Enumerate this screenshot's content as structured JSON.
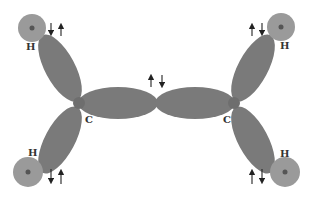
{
  "diagram": {
    "colors": {
      "orbital": "#7a7a7a",
      "hydrogen_shell": "#9a9a9a",
      "nucleus": "#555555",
      "arrow": "#222222",
      "label": "#333333"
    },
    "atoms": [
      {
        "id": "C1",
        "label": "C"
      },
      {
        "id": "C2",
        "label": "C"
      },
      {
        "id": "H1",
        "label": "H",
        "position": "top-left"
      },
      {
        "id": "H2",
        "label": "H",
        "position": "bottom-left"
      },
      {
        "id": "H3",
        "label": "H",
        "position": "top-right"
      },
      {
        "id": "H4",
        "label": "H",
        "position": "bottom-right"
      }
    ],
    "bonds": [
      {
        "from": "C1",
        "to": "C2",
        "electron_spins": "up-down"
      },
      {
        "from": "C1",
        "to": "H1",
        "electron_spins": "down-up"
      },
      {
        "from": "C1",
        "to": "H2",
        "electron_spins": "down-up"
      },
      {
        "from": "C2",
        "to": "H3",
        "electron_spins": "up-down"
      },
      {
        "from": "C2",
        "to": "H4",
        "electron_spins": "up-down"
      }
    ]
  }
}
